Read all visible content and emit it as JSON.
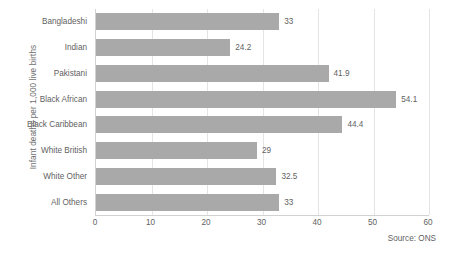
{
  "chart_data": {
    "type": "bar",
    "orientation": "horizontal",
    "title": "",
    "xlabel": "",
    "ylabel": "Infant deaths per 1,000 live births",
    "categories": [
      "Bangladeshi",
      "Indian",
      "Pakistani",
      "Black African",
      "Black Caribbean",
      "White British",
      "White Other",
      "All Others"
    ],
    "values": [
      33,
      24.2,
      41.9,
      54.1,
      44.4,
      29,
      32.5,
      33
    ],
    "value_labels": [
      "33",
      "24.2",
      "41.9",
      "54.1",
      "44.4",
      "29",
      "32.5",
      "33"
    ],
    "xlim": [
      0,
      60
    ],
    "xticks": [
      0,
      10,
      20,
      30,
      40,
      50,
      60
    ],
    "xtick_labels": [
      "0",
      "10",
      "20",
      "30",
      "40",
      "50",
      "60"
    ],
    "grid": true,
    "grid_axis": "x",
    "legend": false,
    "bar_color": "#a9a9a9",
    "axis_color": "#d2d2d2",
    "gridline_color": "#e4e4e4",
    "text_color": "#5f5f5f"
  },
  "annotations": {
    "source": "Source: ONS"
  }
}
